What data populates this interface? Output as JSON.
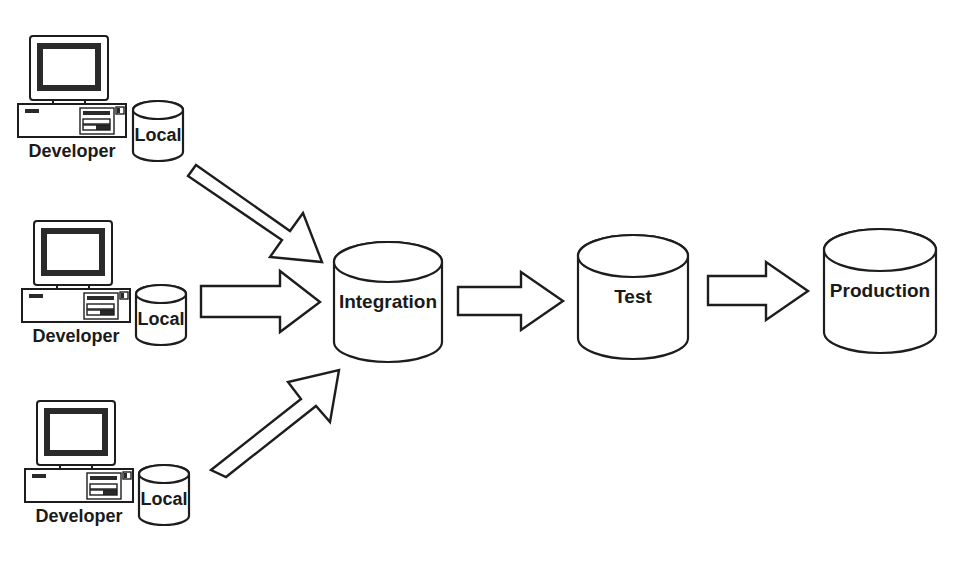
{
  "diagram": {
    "background_color": "#ffffff",
    "stroke_color": "#1d1d1d",
    "text_color": "#1a1a1a",
    "developers": [
      {
        "id": "developer-top",
        "workstation_label": "Developer",
        "repo_label": "Local"
      },
      {
        "id": "developer-middle",
        "workstation_label": "Developer",
        "repo_label": "Local"
      },
      {
        "id": "developer-bottom",
        "workstation_label": "Developer",
        "repo_label": "Local"
      }
    ],
    "stages": [
      {
        "id": "integration",
        "label": "Integration"
      },
      {
        "id": "test",
        "label": "Test"
      },
      {
        "id": "production",
        "label": "Production"
      }
    ],
    "arrows": [
      {
        "id": "arrow-top-to-integration",
        "direction": "down-right",
        "from": "developer-top",
        "to": "integration"
      },
      {
        "id": "arrow-middle-to-integration",
        "direction": "right",
        "from": "developer-middle",
        "to": "integration"
      },
      {
        "id": "arrow-bottom-to-integration",
        "direction": "up-right",
        "from": "developer-bottom",
        "to": "integration"
      },
      {
        "id": "arrow-integration-to-test",
        "direction": "right",
        "from": "integration",
        "to": "test"
      },
      {
        "id": "arrow-test-to-production",
        "direction": "right",
        "from": "test",
        "to": "production"
      }
    ]
  }
}
